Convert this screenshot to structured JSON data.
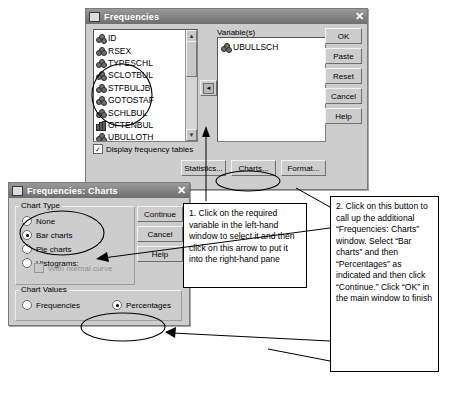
{
  "frequencies": {
    "title": "Frequencies",
    "close_label": "✕",
    "variables_label": "Variable(s)",
    "source_variables": [
      {
        "name": "ID",
        "icon": "cluster-icon"
      },
      {
        "name": "RSEX",
        "icon": "cluster-icon"
      },
      {
        "name": "TYPESCHL",
        "icon": "cluster-icon"
      },
      {
        "name": "SCLOTBUL",
        "icon": "cluster-icon"
      },
      {
        "name": "STFBULJB",
        "icon": "cluster-icon"
      },
      {
        "name": "GOTOSTAF",
        "icon": "cluster-icon"
      },
      {
        "name": "SCHLBUL",
        "icon": "cluster-icon"
      },
      {
        "name": "OFTENBUL",
        "icon": "bar-icon"
      },
      {
        "name": "UBULLOTH",
        "icon": "cluster-icon"
      }
    ],
    "selected_variables": [
      {
        "name": "UBULLSCH",
        "icon": "cluster-icon"
      }
    ],
    "move_arrow_label": "◄",
    "display_frequency_tables": {
      "label": "Display frequency tables",
      "checked": true,
      "mark": "✓"
    },
    "side_buttons": [
      "OK",
      "Paste",
      "Reset",
      "Cancel",
      "Help"
    ],
    "bottom_buttons": [
      "Statistics...",
      "Charts...",
      "Format..."
    ],
    "scroll_up": "▲",
    "scroll_down": "▼"
  },
  "charts_dialog": {
    "title": "Frequencies: Charts",
    "close_label": "✕",
    "chart_type_label": "Chart Type",
    "chart_type_options": [
      {
        "label": "None",
        "selected": false,
        "disabled": false
      },
      {
        "label": "Bar charts",
        "selected": true,
        "disabled": false
      },
      {
        "label": "Pie charts",
        "selected": false,
        "disabled": false
      },
      {
        "label": "Histograms:",
        "selected": false,
        "disabled": false
      }
    ],
    "with_normal_curve": {
      "label": "With normal curve",
      "checked": false,
      "disabled": true
    },
    "chart_values_label": "Chart Values",
    "chart_values_options": [
      {
        "label": "Frequencies",
        "selected": false
      },
      {
        "label": "Percentages",
        "selected": true
      }
    ],
    "buttons": [
      "Continue",
      "Cancel",
      "Help"
    ]
  },
  "annotations": {
    "callout_1": "1. Click on the required variable in the left-hand window to select it and then click on this arrow to put it into the right-hand pane",
    "callout_2": "2. Click on this button to call up the additional “Frequencies: Charts” window. Select “Bar charts” and then “Percentages” as indicated and then click “Continue.” Click “OK” in the main window to finish"
  }
}
